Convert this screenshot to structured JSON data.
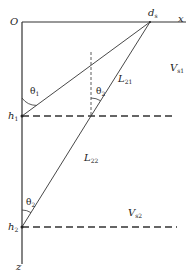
{
  "diagram": {
    "origin_label": "O",
    "x_axis_label": "x",
    "z_axis_label": "z",
    "source_point": {
      "label": "d",
      "subscript": "s"
    },
    "interfaces": [
      {
        "label": "h",
        "subscript": "1"
      },
      {
        "label": "h",
        "subscript": "2"
      }
    ],
    "angles": [
      {
        "label": "θ",
        "subscript": "1"
      },
      {
        "label": "θ",
        "subscript": "2"
      },
      {
        "label": "θ",
        "subscript": "2"
      }
    ],
    "rays": [
      {
        "label": "L",
        "subscript": "21"
      },
      {
        "label": "L",
        "subscript": "22"
      }
    ],
    "layers": [
      {
        "label": "V",
        "subscript": "s1"
      },
      {
        "label": "V",
        "subscript": "s2"
      }
    ],
    "colors": {
      "line": "#333333",
      "background": "#ffffff"
    }
  }
}
